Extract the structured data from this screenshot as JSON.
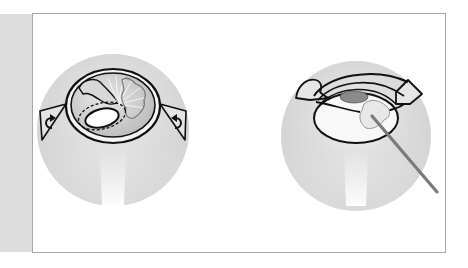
{
  "figure": {
    "panels": [
      {
        "id": "left",
        "description": "Eye with lens capsule opened, iris pulled aside with dashed capsulorhexis outline; rotation arrows on both sides",
        "icons": [
          "rotate-left-arrow-icon",
          "rotate-right-arrow-icon"
        ]
      },
      {
        "id": "right",
        "description": "Cross-section of eye with lens fragment being manipulated by a surgical probe",
        "icons": [
          "surgical-probe-icon"
        ]
      }
    ],
    "colors": {
      "sidebar": "#dcdcdc",
      "frame_border": "#a8a8a8",
      "globe_shade": "#cfcfcf",
      "outline": "#111111",
      "lens_nucleus": "#8a8a8a",
      "probe": "#7a7a7a",
      "fragment": "#e6e6e6"
    }
  }
}
